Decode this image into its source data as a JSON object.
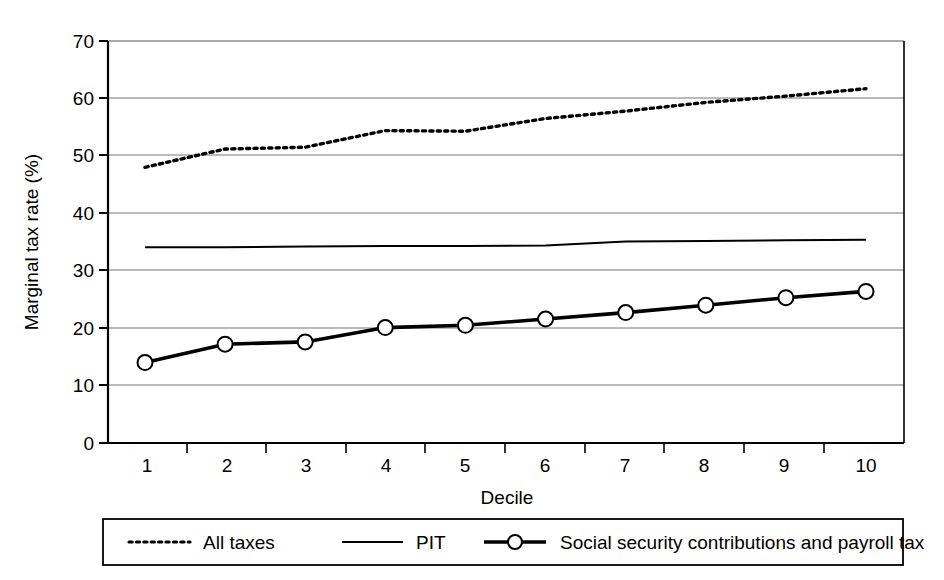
{
  "chart_data": {
    "type": "line",
    "title": "",
    "xlabel": "Decile",
    "ylabel": "Marginal tax rate (%)",
    "xlim": [
      0.5,
      10.5
    ],
    "ylim": [
      0,
      70
    ],
    "ytick_values": [
      0,
      10,
      20,
      30,
      40,
      50,
      60,
      70
    ],
    "ytick_labels": [
      "0",
      "10",
      "20",
      "30",
      "40",
      "50",
      "60",
      "70"
    ],
    "xtick_labels": [
      "1",
      "2",
      "3",
      "4",
      "5",
      "6",
      "7",
      "8",
      "9",
      "10"
    ],
    "x": [
      1,
      2,
      3,
      4,
      5,
      6,
      7,
      8,
      9,
      10
    ],
    "grid": "horizontal",
    "legend_position": "below-outside",
    "series": [
      {
        "name": "All taxes",
        "style": "dotted",
        "marker": "none",
        "color": "#000000",
        "values": [
          48.0,
          51.2,
          51.5,
          54.4,
          54.3,
          56.5,
          57.8,
          59.3,
          60.4,
          61.7
        ]
      },
      {
        "name": "PIT",
        "style": "solid-thin",
        "marker": "none",
        "color": "#000000",
        "values": [
          34.1,
          34.1,
          34.2,
          34.3,
          34.3,
          34.4,
          35.1,
          35.2,
          35.3,
          35.4
        ]
      },
      {
        "name": "Social security contributions and payroll tax",
        "style": "solid-thick",
        "marker": "circle",
        "color": "#000000",
        "values": [
          14.0,
          17.2,
          17.6,
          20.1,
          20.5,
          21.6,
          22.7,
          24.0,
          25.3,
          26.4
        ]
      }
    ]
  },
  "legend": {
    "items": [
      {
        "label": "All taxes",
        "swatch": "dotted-line-swatch"
      },
      {
        "label": "PIT",
        "swatch": "solid-line-swatch"
      },
      {
        "label": "Social security contributions and payroll tax",
        "swatch": "marker-line-swatch"
      }
    ]
  },
  "colors": {
    "ink": "#000000",
    "gridline": "#6d6d6d",
    "axis": "#000000",
    "background": "#ffffff"
  }
}
